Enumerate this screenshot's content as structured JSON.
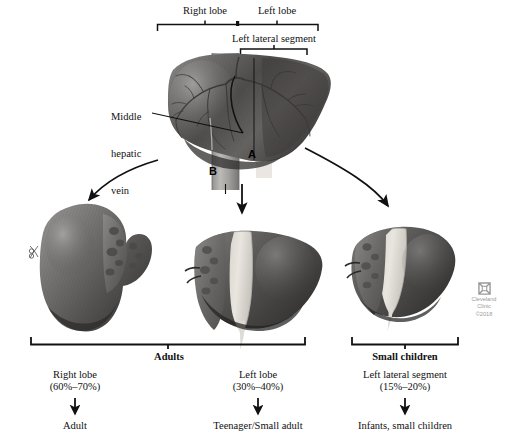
{
  "figure": {
    "background_color": "#ffffff",
    "ink_color": "#111111"
  },
  "top_brackets": [
    {
      "name": "right-lobe",
      "label": "Right lobe"
    },
    {
      "name": "left-lobe",
      "label": "Left lobe"
    },
    {
      "name": "left-lateral-segment",
      "label": "Left lateral segment"
    }
  ],
  "callout": {
    "label": "Middle\nhepatic\nvein",
    "line1": "Middle",
    "line2": "hepatic",
    "line3": "vein"
  },
  "anatomy_markers": [
    {
      "name": "marker-a",
      "label": "A"
    },
    {
      "name": "marker-b",
      "label": "B"
    }
  ],
  "group_brackets": [
    {
      "name": "adults",
      "label": "Adults"
    },
    {
      "name": "small-children",
      "label": "Small children"
    }
  ],
  "grafts": [
    {
      "name": "right-lobe-graft",
      "segment": "Right lobe",
      "percentage": "(60%–70%)",
      "recipient": "Adult"
    },
    {
      "name": "left-lobe-graft",
      "segment": "Left lobe",
      "percentage": "(30%–40%)",
      "recipient": "Teenager/Small adult"
    },
    {
      "name": "left-lateral-segment-graft",
      "segment": "Left lateral segment",
      "percentage": "(15%–20%)",
      "recipient": "Infants, small children"
    }
  ],
  "credit": {
    "organization_line1": "Cleveland",
    "organization_line2": "Clinic",
    "copyright": "©2018",
    "color": "#9a9a9a"
  }
}
